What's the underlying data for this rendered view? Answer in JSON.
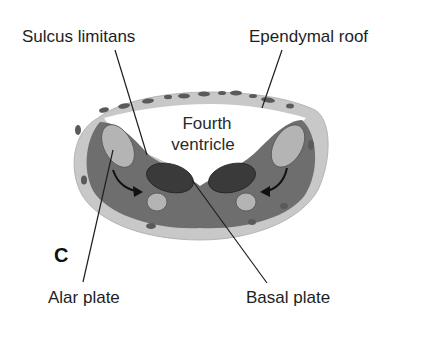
{
  "figure": {
    "panel_letter": "C",
    "labels": {
      "sulcus_limitans": "Sulcus limitans",
      "ependymal_roof": "Ependymal roof",
      "fourth_ventricle_line1": "Fourth",
      "fourth_ventricle_line2": "ventricle",
      "alar_plate": "Alar plate",
      "basal_plate": "Basal plate"
    },
    "colors": {
      "background": "#ffffff",
      "outer_layer": "#c8c8c8",
      "mantle_layer": "#6e6e6e",
      "alar_nucleus": "#b4b4b4",
      "basal_nucleus": "#3a3a3a",
      "vessel": "#5a5a5a",
      "text": "#1e1e1e"
    }
  }
}
